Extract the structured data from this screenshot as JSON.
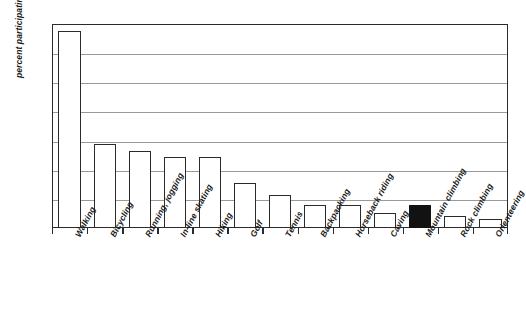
{
  "chart_data": {
    "type": "bar",
    "title": "",
    "xlabel": "",
    "ylabel": "percent participating",
    "ylim": [
      0,
      70
    ],
    "ytick_labels": [
      "0%",
      "10%",
      "20%",
      "30%",
      "40%",
      "50%",
      "60%",
      "70%"
    ],
    "ytick_values": [
      0,
      10,
      20,
      30,
      40,
      50,
      60,
      70
    ],
    "grid": true,
    "legend": "none",
    "categories": [
      "Walking",
      "Bicycling",
      "Running, jogging",
      "In-line skating",
      "Hiking",
      "Golf",
      "Tennis",
      "Backpacking",
      "Horseback riding",
      "Caving",
      "Mountain climbing",
      "Rock climbing",
      "Orienteering"
    ],
    "values": [
      67.5,
      28.8,
      26.5,
      24.5,
      24.3,
      15.5,
      11.5,
      8.0,
      7.8,
      5.0,
      8.0,
      4.0,
      3.0
    ],
    "highlighted_category": "Mountain climbing",
    "highlight_color": "#121212",
    "bar_fill_color": "#ffffff",
    "bar_edge_color": "#2b2b2b",
    "gridline_color": "#9a9a9a",
    "axis_color": "#2b2b2b"
  }
}
